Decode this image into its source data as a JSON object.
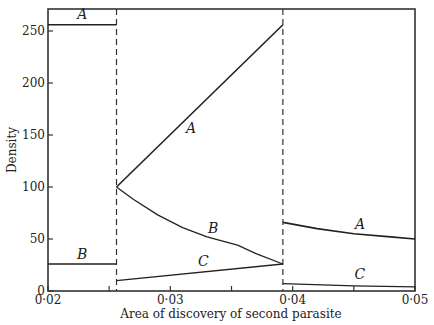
{
  "chart_data": {
    "type": "line",
    "title": "",
    "xlabel": "Area of discovery of second parasite",
    "ylabel": "Density",
    "xlim": [
      0.02,
      0.05
    ],
    "ylim": [
      0,
      270
    ],
    "grid": false,
    "legend": "none (curves labelled inline A, B, C)",
    "x_ticks": [
      "0·02",
      "0·03",
      "0·04",
      "0·05"
    ],
    "x_tick_values": [
      0.02,
      0.03,
      0.04,
      0.05
    ],
    "x_minor_ticks": [
      0.025,
      0.035,
      0.045
    ],
    "y_ticks": [
      "0",
      "50",
      "100",
      "150",
      "200",
      "250"
    ],
    "y_tick_values": [
      0,
      50,
      100,
      150,
      200,
      250
    ],
    "boundaries": [
      0.0256,
      0.0392
    ],
    "boundary_style": "dashed vertical",
    "series": [
      {
        "name": "A",
        "region": 1,
        "points": [
          [
            0.02,
            256
          ],
          [
            0.0256,
            256
          ]
        ]
      },
      {
        "name": "B",
        "region": 1,
        "points": [
          [
            0.02,
            26
          ],
          [
            0.0256,
            26
          ]
        ]
      },
      {
        "name": "A",
        "region": 2,
        "points": [
          [
            0.0256,
            100
          ],
          [
            0.0392,
            256
          ]
        ]
      },
      {
        "name": "B",
        "region": 2,
        "points": [
          [
            0.0256,
            100
          ],
          [
            0.027,
            88
          ],
          [
            0.029,
            73
          ],
          [
            0.031,
            61
          ],
          [
            0.033,
            52
          ],
          [
            0.0355,
            44
          ],
          [
            0.037,
            36
          ],
          [
            0.0392,
            26
          ]
        ]
      },
      {
        "name": "C",
        "region": 2,
        "points": [
          [
            0.0256,
            10
          ],
          [
            0.0392,
            26
          ]
        ]
      },
      {
        "name": "A",
        "region": 3,
        "points": [
          [
            0.0392,
            66
          ],
          [
            0.042,
            60
          ],
          [
            0.045,
            55
          ],
          [
            0.048,
            52
          ],
          [
            0.05,
            50
          ]
        ]
      },
      {
        "name": "C",
        "region": 3,
        "points": [
          [
            0.0392,
            7
          ],
          [
            0.045,
            5
          ],
          [
            0.05,
            4
          ]
        ]
      }
    ],
    "labels": [
      {
        "text": "A",
        "x": 0.0228,
        "y": 262
      },
      {
        "text": "B",
        "x": 0.0228,
        "y": 31
      },
      {
        "text": "A",
        "x": 0.0317,
        "y": 152
      },
      {
        "text": "B",
        "x": 0.0335,
        "y": 56
      },
      {
        "text": "C",
        "x": 0.0327,
        "y": 24
      },
      {
        "text": "A",
        "x": 0.0455,
        "y": 60
      },
      {
        "text": "C",
        "x": 0.0455,
        "y": 12
      }
    ]
  }
}
